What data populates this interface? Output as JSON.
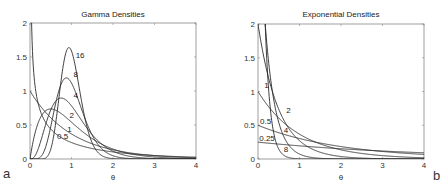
{
  "chart_data": [
    {
      "type": "line",
      "title": "Gamma Densities",
      "xlabel": "θ",
      "ylabel": "",
      "panel_label": "a",
      "xlim": [
        0,
        4
      ],
      "ylim": [
        0,
        2
      ],
      "xticks": [
        "0",
        "1",
        "2",
        "3",
        "4"
      ],
      "yticks": [
        "0",
        "0.5",
        "1",
        "1.5",
        "2"
      ],
      "grid": false,
      "family": "gamma",
      "x": [
        0,
        0.25,
        0.5,
        0.75,
        1,
        1.25,
        1.5,
        2,
        2.5,
        3,
        4
      ],
      "series": [
        {
          "name": "0.5",
          "shape": 0.5,
          "rate": 0.5,
          "label_pos": [
            0.65,
            0.3
          ],
          "values": [
            null,
            0.55,
            0.31,
            0.22,
            0.16,
            0.13,
            0.1,
            0.07,
            0.05,
            0.03,
            0.02
          ]
        },
        {
          "name": "1",
          "shape": 1,
          "rate": 1,
          "label_pos": [
            0.9,
            0.39
          ],
          "values": [
            1.0,
            0.78,
            0.61,
            0.47,
            0.37,
            0.29,
            0.22,
            0.14,
            0.08,
            0.05,
            0.02
          ]
        },
        {
          "name": "2",
          "shape": 2,
          "rate": 2,
          "label_pos": [
            0.95,
            0.6
          ],
          "values": [
            0,
            0.61,
            0.74,
            0.67,
            0.54,
            0.41,
            0.3,
            0.15,
            0.07,
            0.03,
            0.01
          ]
        },
        {
          "name": "4",
          "shape": 4,
          "rate": 4,
          "label_pos": [
            1.05,
            0.9
          ],
          "values": [
            0,
            0.1,
            0.72,
            0.9,
            0.78,
            0.56,
            0.36,
            0.11,
            0.03,
            0.01,
            0.0
          ]
        },
        {
          "name": "8",
          "shape": 8,
          "rate": 8,
          "label_pos": [
            1.05,
            1.2
          ],
          "values": [
            0,
            0.0,
            0.24,
            1.07,
            1.14,
            0.69,
            0.3,
            0.03,
            0.0,
            0.0,
            0.0
          ]
        },
        {
          "name": "16",
          "shape": 16,
          "rate": 16,
          "label_pos": [
            1.1,
            1.48
          ],
          "values": [
            0,
            0.0,
            0.04,
            1.04,
            1.6,
            0.76,
            0.17,
            0.0,
            0.0,
            0.0,
            0.0
          ]
        }
      ]
    },
    {
      "type": "line",
      "title": "Exponential Densities",
      "xlabel": "θ",
      "ylabel": "",
      "panel_label": "b",
      "xlim": [
        0,
        4
      ],
      "ylim": [
        0,
        2
      ],
      "xticks": [
        "0",
        "1",
        "2",
        "3",
        "4"
      ],
      "yticks": [
        "0",
        "0.5",
        "1",
        "1.5",
        "2"
      ],
      "grid": false,
      "family": "exponential",
      "x": [
        0,
        0.25,
        0.5,
        0.75,
        1,
        1.5,
        2,
        3,
        4
      ],
      "series": [
        {
          "name": "0.25",
          "rate": 0.25,
          "label_pos": [
            0.03,
            0.27
          ],
          "values": [
            0.25,
            0.235,
            0.22,
            0.207,
            0.195,
            0.172,
            0.152,
            0.118,
            0.092
          ]
        },
        {
          "name": "0.5",
          "rate": 0.5,
          "label_pos": [
            0.05,
            0.52
          ],
          "values": [
            0.5,
            0.44,
            0.39,
            0.34,
            0.3,
            0.24,
            0.18,
            0.11,
            0.07
          ]
        },
        {
          "name": "1",
          "rate": 1,
          "label_pos": [
            0.15,
            1.05
          ],
          "values": [
            1.0,
            0.78,
            0.61,
            0.47,
            0.37,
            0.22,
            0.14,
            0.05,
            0.02
          ]
        },
        {
          "name": "2",
          "rate": 2,
          "label_pos": [
            0.68,
            0.68
          ],
          "values": [
            2.0,
            1.21,
            0.74,
            0.45,
            0.27,
            0.1,
            0.04,
            0.005,
            0.0
          ]
        },
        {
          "name": "4",
          "rate": 4,
          "label_pos": [
            0.62,
            0.39
          ],
          "values": [
            4.0,
            1.47,
            0.54,
            0.2,
            0.07,
            0.01,
            0.0,
            0.0,
            0.0
          ]
        },
        {
          "name": "8",
          "rate": 8,
          "label_pos": [
            0.62,
            0.1
          ],
          "values": [
            8.0,
            1.08,
            0.15,
            0.02,
            0.0,
            0.0,
            0.0,
            0.0,
            0.0
          ]
        }
      ]
    }
  ]
}
